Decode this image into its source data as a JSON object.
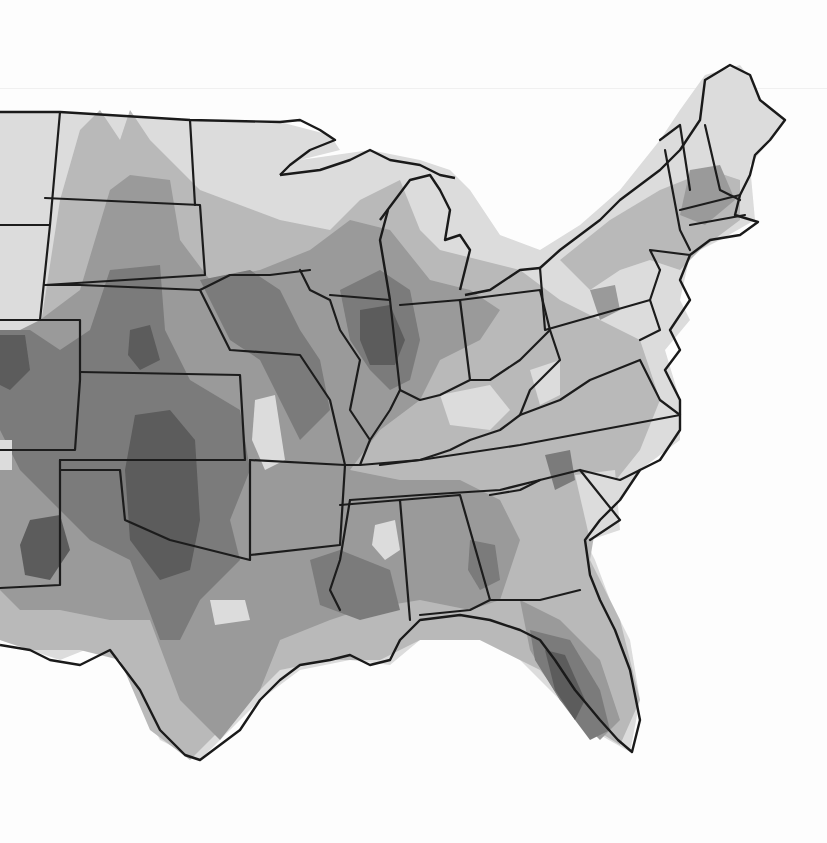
{
  "map": {
    "region": "Central and Eastern United States",
    "style": "grayscale contour / density shading with state boundaries",
    "levels": [
      {
        "level": 1,
        "color": "#dcdcdc"
      },
      {
        "level": 2,
        "color": "#b9b9b9"
      },
      {
        "level": 3,
        "color": "#9a9a9a"
      },
      {
        "level": 4,
        "color": "#7b7b7b"
      },
      {
        "level": 5,
        "color": "#5c5c5c"
      }
    ],
    "background_color": "#fdfdfd",
    "boundary_color": "#1c1c1c"
  }
}
